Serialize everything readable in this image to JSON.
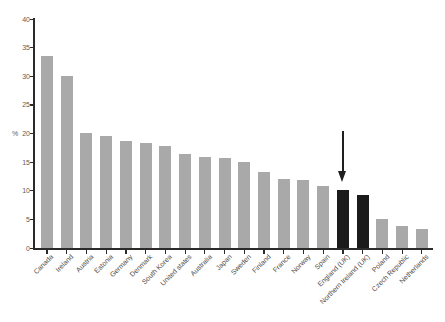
{
  "chart_data": {
    "type": "bar",
    "title": "",
    "xlabel": "",
    "ylabel": "%",
    "ylabel_at_tick": 20,
    "ylim": [
      0,
      40
    ],
    "yticks": [
      0,
      5,
      10,
      15,
      20,
      25,
      30,
      35,
      40
    ],
    "grid": false,
    "legend": null,
    "categories": [
      "Canada",
      "Ireland",
      "Austria",
      "Estonia",
      "Germany",
      "Denmark",
      "South Korea",
      "United states",
      "Australia",
      "Japan",
      "Sweden",
      "Finland",
      "France",
      "Norway",
      "Spain",
      "England (UK)",
      "Northern Ireland (UK)",
      "Poland",
      "Czech Republic",
      "Netherlands"
    ],
    "values": [
      33.6,
      30.0,
      20.1,
      19.6,
      18.7,
      18.3,
      17.9,
      16.4,
      15.9,
      15.7,
      15.0,
      13.3,
      12.1,
      11.8,
      10.8,
      10.2,
      9.3,
      5.0,
      3.9,
      3.3
    ],
    "highlighted_categories": [
      "England (UK)",
      "Northern Ireland (UK)"
    ],
    "annotation": {
      "type": "down-arrow",
      "target": "England (UK)"
    },
    "colors": {
      "bar": "#a9a9a9",
      "highlight": "#1b1b1b",
      "axis": "#2b2b2b",
      "tick_label": "#5f5b57"
    }
  }
}
